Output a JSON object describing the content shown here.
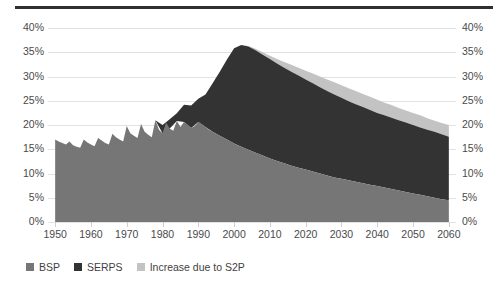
{
  "chart_data": {
    "type": "area",
    "title": "",
    "subtitle": "",
    "xlabel": "",
    "ylabel": "",
    "stacked": true,
    "grid": true,
    "legend_position": "bottom-left",
    "xlim": [
      1948,
      2062
    ],
    "ylim": [
      0,
      40
    ],
    "y_tick_labels": [
      "40%",
      "35%",
      "30%",
      "25%",
      "20%",
      "15%",
      "10%",
      "5%",
      "0%"
    ],
    "y_tick_values": [
      40,
      35,
      30,
      25,
      20,
      15,
      10,
      5,
      0
    ],
    "x_tick_labels": [
      "1950",
      "1960",
      "1970",
      "1980",
      "1990",
      "2000",
      "2010",
      "2020",
      "2030",
      "2040",
      "2050",
      "2060"
    ],
    "x_tick_values": [
      1950,
      1960,
      1970,
      1980,
      1990,
      2000,
      2010,
      2020,
      2030,
      2040,
      2050,
      2060
    ],
    "dual_y_axis": true,
    "colors": {
      "bsp": "#767676",
      "serps": "#333333",
      "s2p": "#c3c3c3",
      "gridline": "#e2e2e2",
      "text": "#4a4a4a",
      "top_rule": "#2f2f2f"
    },
    "series": [
      {
        "name": "BSP",
        "color": "#767676",
        "x": [
          1950,
          1951,
          1952,
          1953,
          1954,
          1955,
          1956,
          1957,
          1958,
          1959,
          1960,
          1961,
          1962,
          1963,
          1964,
          1965,
          1966,
          1967,
          1968,
          1969,
          1970,
          1971,
          1972,
          1973,
          1974,
          1975,
          1976,
          1977,
          1978,
          1979,
          1980,
          1981,
          1982,
          1983,
          1984,
          1985,
          1986,
          1987,
          1988,
          1989,
          1990,
          1991,
          1992,
          1993,
          1994,
          1995,
          1996,
          1997,
          1998,
          1999,
          2000,
          2001,
          2002,
          2003,
          2004,
          2005,
          2006,
          2007,
          2008,
          2009,
          2010,
          2012,
          2014,
          2016,
          2018,
          2020,
          2022,
          2024,
          2026,
          2028,
          2030,
          2032,
          2034,
          2036,
          2038,
          2040,
          2042,
          2044,
          2046,
          2048,
          2050,
          2052,
          2054,
          2056,
          2058,
          2060
        ],
        "values": [
          17.0,
          16.6,
          16.3,
          16.0,
          16.6,
          15.8,
          15.5,
          15.3,
          17.0,
          16.4,
          16.0,
          15.6,
          17.3,
          16.8,
          16.3,
          16.0,
          18.2,
          17.5,
          17.0,
          16.6,
          19.8,
          18.3,
          17.8,
          17.3,
          20.2,
          18.6,
          18.0,
          17.5,
          21.0,
          19.0,
          18.3,
          20.5,
          19.3,
          18.8,
          20.8,
          19.6,
          20.6,
          20.1,
          19.4,
          19.8,
          20.6,
          20.2,
          19.6,
          19.0,
          18.6,
          18.2,
          17.8,
          17.4,
          17.0,
          16.6,
          16.2,
          15.8,
          15.5,
          15.2,
          14.9,
          14.6,
          14.3,
          14.0,
          13.7,
          13.4,
          13.1,
          12.6,
          12.1,
          11.6,
          11.2,
          10.8,
          10.4,
          10.0,
          9.6,
          9.2,
          8.9,
          8.6,
          8.3,
          8.0,
          7.7,
          7.4,
          7.1,
          6.8,
          6.5,
          6.2,
          5.9,
          5.6,
          5.3,
          5.0,
          4.7,
          4.5
        ]
      },
      {
        "name": "SERPS",
        "color": "#333333",
        "x": [
          1978,
          1980,
          1982,
          1984,
          1986,
          1988,
          1990,
          1992,
          1994,
          1996,
          1998,
          2000,
          2002,
          2004,
          2006,
          2008,
          2010,
          2012,
          2014,
          2016,
          2018,
          2020,
          2022,
          2024,
          2026,
          2028,
          2030,
          2032,
          2034,
          2036,
          2038,
          2040,
          2042,
          2044,
          2046,
          2048,
          2050,
          2052,
          2054,
          2056,
          2058,
          2060
        ],
        "cumulative_top": [
          21.0,
          20.0,
          21.2,
          22.4,
          24.2,
          24.0,
          25.4,
          26.3,
          28.6,
          31.0,
          33.5,
          35.8,
          36.5,
          36.2,
          35.4,
          34.5,
          33.6,
          32.7,
          31.8,
          31.0,
          30.2,
          29.4,
          28.6,
          27.8,
          27.0,
          26.3,
          25.6,
          24.9,
          24.3,
          23.7,
          23.1,
          22.5,
          22.0,
          21.5,
          21.0,
          20.5,
          20.0,
          19.5,
          19.0,
          18.6,
          18.1,
          17.6
        ]
      },
      {
        "name": "Increase due to S2P",
        "color": "#c3c3c3",
        "x": [
          2002,
          2004,
          2006,
          2008,
          2010,
          2012,
          2014,
          2016,
          2018,
          2020,
          2022,
          2024,
          2026,
          2028,
          2030,
          2032,
          2034,
          2036,
          2038,
          2040,
          2042,
          2044,
          2046,
          2048,
          2050,
          2052,
          2054,
          2056,
          2058,
          2060
        ],
        "cumulative_top": [
          36.5,
          36.3,
          35.7,
          35.0,
          34.3,
          33.6,
          33.0,
          32.4,
          31.8,
          31.2,
          30.6,
          30.0,
          29.4,
          28.8,
          28.2,
          27.6,
          27.0,
          26.4,
          25.8,
          25.2,
          24.6,
          24.1,
          23.5,
          23.0,
          22.5,
          22.0,
          21.4,
          20.9,
          20.4,
          20.0
        ]
      }
    ]
  },
  "legend": {
    "items": [
      {
        "label": "BSP",
        "color": "#767676"
      },
      {
        "label": "SERPS",
        "color": "#333333"
      },
      {
        "label": "Increase due to S2P",
        "color": "#c3c3c3"
      }
    ]
  }
}
